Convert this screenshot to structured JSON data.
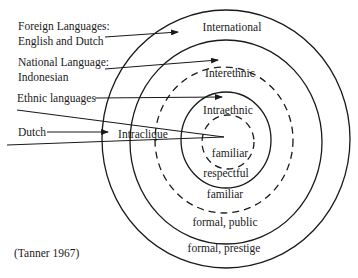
{
  "diagram": {
    "citation": "(Tanner 1967)",
    "left_labels": [
      {
        "id": "foreign",
        "lines": [
          "Foreign Languages:",
          "English and Dutch"
        ]
      },
      {
        "id": "national",
        "lines": [
          "National Language:",
          "Indonesian"
        ]
      },
      {
        "id": "ethnic",
        "lines": [
          "Ethnic languages"
        ]
      },
      {
        "id": "dutch",
        "lines": [
          "Dutch"
        ]
      }
    ],
    "domains": {
      "international": "International",
      "interethnic": "Interethnic",
      "intraethnic": "Intraethnic",
      "intraclique": "Intraclique"
    },
    "registers": {
      "inner_familiar": "familiar",
      "respectful": "respectful",
      "middle_familiar": "familiar",
      "formal_public": "formal, public",
      "formal_prestige": "formal, prestige"
    },
    "rings": [
      {
        "name": "international",
        "style": "solid"
      },
      {
        "name": "interethnic-outer",
        "style": "solid"
      },
      {
        "name": "interethnic-inner",
        "style": "dashed"
      },
      {
        "name": "intraethnic",
        "style": "solid"
      },
      {
        "name": "intraclique",
        "style": "dashed"
      }
    ],
    "colors": {
      "ink": "#1a1a1a",
      "background": "#ffffff"
    }
  }
}
